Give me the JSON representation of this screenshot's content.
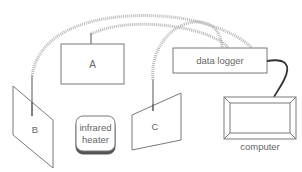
{
  "diagram": {
    "type": "experimental-setup",
    "colors": {
      "outline": "#7a7a7a",
      "cable_coiled": "#b8b8b8",
      "cable_solid": "#333333",
      "text": "#666666",
      "background": "#ffffff"
    },
    "nodes": {
      "sensor_a": {
        "label": "A"
      },
      "sensor_b": {
        "label": "B"
      },
      "sensor_c": {
        "label": "C"
      },
      "heater": {
        "label_line1": "infrared",
        "label_line2": "heater"
      },
      "data_logger": {
        "label": "data logger"
      },
      "computer": {
        "label": "computer"
      }
    },
    "connections": [
      {
        "from": "sensor_b",
        "to": "data_logger",
        "style": "coiled"
      },
      {
        "from": "sensor_a",
        "to": "data_logger",
        "style": "coiled"
      },
      {
        "from": "sensor_c",
        "to": "data_logger",
        "style": "coiled"
      },
      {
        "from": "data_logger",
        "to": "computer",
        "style": "solid"
      }
    ]
  }
}
